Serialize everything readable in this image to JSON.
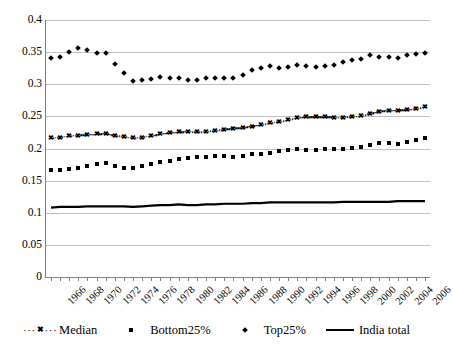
{
  "chart_data": {
    "type": "line",
    "title": "",
    "xlabel": "",
    "ylabel": "",
    "ylim": [
      0,
      0.4
    ],
    "ytick_values": [
      0,
      0.05,
      0.1,
      0.15,
      0.2,
      0.25,
      0.3,
      0.35,
      0.4
    ],
    "ytick_labels": [
      "0",
      "0.05",
      "0.1",
      "0.15",
      "0.2",
      "0.25",
      "0.3",
      "0.35",
      "0.4"
    ],
    "grid": true,
    "legend_position": "bottom",
    "x": [
      1966,
      1967,
      1968,
      1969,
      1970,
      1971,
      1972,
      1973,
      1974,
      1975,
      1976,
      1977,
      1978,
      1979,
      1980,
      1981,
      1982,
      1983,
      1984,
      1985,
      1986,
      1987,
      1988,
      1989,
      1990,
      1991,
      1992,
      1993,
      1994,
      1995,
      1996,
      1997,
      1998,
      1999,
      2000,
      2001,
      2002,
      2003,
      2004,
      2005,
      2006,
      2007
    ],
    "xtick_labels": [
      "1966",
      "1968",
      "1970",
      "1972",
      "1974",
      "1976",
      "1978",
      "1980",
      "1982",
      "1984",
      "1986",
      "1988",
      "1990",
      "1992",
      "1994",
      "1996",
      "1998",
      "2000",
      "2002",
      "2004",
      "2006"
    ],
    "xtick_step": 2,
    "series": [
      {
        "name": "Median",
        "marker": "x",
        "line_style": "dotted",
        "color": "#000000",
        "values": [
          0.216,
          0.217,
          0.219,
          0.22,
          0.221,
          0.222,
          0.223,
          0.22,
          0.218,
          0.216,
          0.217,
          0.219,
          0.222,
          0.224,
          0.225,
          0.226,
          0.225,
          0.226,
          0.227,
          0.229,
          0.231,
          0.232,
          0.234,
          0.236,
          0.239,
          0.241,
          0.244,
          0.247,
          0.249,
          0.249,
          0.249,
          0.248,
          0.248,
          0.249,
          0.25,
          0.254,
          0.257,
          0.259,
          0.259,
          0.26,
          0.261,
          0.264
        ]
      },
      {
        "name": "Bottom25%",
        "marker": "square",
        "line_style": "none",
        "color": "#000000",
        "values": [
          0.167,
          0.167,
          0.168,
          0.17,
          0.173,
          0.176,
          0.177,
          0.173,
          0.17,
          0.17,
          0.173,
          0.176,
          0.179,
          0.181,
          0.183,
          0.185,
          0.186,
          0.186,
          0.188,
          0.188,
          0.186,
          0.188,
          0.191,
          0.192,
          0.193,
          0.196,
          0.198,
          0.2,
          0.197,
          0.198,
          0.199,
          0.2,
          0.2,
          0.201,
          0.203,
          0.206,
          0.208,
          0.208,
          0.207,
          0.21,
          0.213,
          0.217
        ]
      },
      {
        "name": "Top25%",
        "marker": "diamond",
        "line_style": "none",
        "color": "#000000",
        "values": [
          0.341,
          0.343,
          0.35,
          0.357,
          0.353,
          0.348,
          0.348,
          0.331,
          0.317,
          0.305,
          0.306,
          0.308,
          0.312,
          0.31,
          0.309,
          0.306,
          0.307,
          0.309,
          0.31,
          0.31,
          0.31,
          0.314,
          0.322,
          0.325,
          0.328,
          0.326,
          0.327,
          0.33,
          0.328,
          0.327,
          0.328,
          0.33,
          0.334,
          0.337,
          0.34,
          0.346,
          0.342,
          0.342,
          0.341,
          0.345,
          0.347,
          0.348
        ]
      },
      {
        "name": "India total",
        "marker": "none",
        "line_style": "solid",
        "color": "#000000",
        "values": [
          0.108,
          0.109,
          0.109,
          0.109,
          0.11,
          0.11,
          0.11,
          0.11,
          0.11,
          0.109,
          0.11,
          0.111,
          0.112,
          0.112,
          0.113,
          0.112,
          0.112,
          0.113,
          0.113,
          0.114,
          0.114,
          0.114,
          0.115,
          0.115,
          0.116,
          0.116,
          0.116,
          0.116,
          0.116,
          0.116,
          0.116,
          0.116,
          0.117,
          0.117,
          0.117,
          0.117,
          0.117,
          0.117,
          0.118,
          0.118,
          0.118,
          0.118
        ]
      }
    ]
  },
  "legend": {
    "items": [
      {
        "label": "Median",
        "key": "dotted-x-marker-key"
      },
      {
        "label": "Bottom25%",
        "key": "square-marker-key"
      },
      {
        "label": "Top25%",
        "key": "diamond-marker-key"
      },
      {
        "label": "India total",
        "key": "solid-line-key"
      }
    ]
  }
}
